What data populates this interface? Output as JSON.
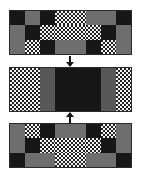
{
  "figure": {
    "name": "three-stage-block-pattern-diagram",
    "background": "#ffffff",
    "width": 141,
    "height": 177
  },
  "palette": {
    "grey": "#6e6e6e",
    "midgrey": "#585858",
    "dark": "#171717",
    "light": "#f2f2f2",
    "border": "#2b2b2b",
    "arrow": "#151515"
  },
  "legend_keys": [
    {
      "key": "grey",
      "label": "grey"
    },
    {
      "key": "dark",
      "label": "dark-speckled"
    },
    {
      "key": "light",
      "label": "light-hatched"
    },
    {
      "key": "midgrey",
      "label": "mid-grey"
    }
  ],
  "panels": [
    {
      "id": "panel-top",
      "name": "panel-top",
      "x": 9,
      "y": 10,
      "width": 123,
      "height": 45,
      "cols": 8,
      "rows": 3,
      "cells": [
        {
          "c": 1,
          "r": 1,
          "cw": 1,
          "ch": 1,
          "fill": "dark"
        },
        {
          "c": 2,
          "r": 1,
          "cw": 1,
          "ch": 1,
          "fill": "grey"
        },
        {
          "c": 3,
          "r": 1,
          "cw": 1,
          "ch": 1,
          "fill": "dark"
        },
        {
          "c": 4,
          "r": 1,
          "cw": 1,
          "ch": 1,
          "fill": "light"
        },
        {
          "c": 5,
          "r": 1,
          "cw": 1,
          "ch": 1,
          "fill": "light"
        },
        {
          "c": 6,
          "r": 1,
          "cw": 1,
          "ch": 1,
          "fill": "grey"
        },
        {
          "c": 7,
          "r": 1,
          "cw": 1,
          "ch": 1,
          "fill": "grey"
        },
        {
          "c": 8,
          "r": 1,
          "cw": 1,
          "ch": 1,
          "fill": "dark"
        },
        {
          "c": 1,
          "r": 2,
          "cw": 1,
          "ch": 1,
          "fill": "grey"
        },
        {
          "c": 2,
          "r": 2,
          "cw": 1,
          "ch": 1,
          "fill": "dark"
        },
        {
          "c": 3,
          "r": 2,
          "cw": 1,
          "ch": 1,
          "fill": "light"
        },
        {
          "c": 4,
          "r": 2,
          "cw": 1,
          "ch": 1,
          "fill": "light"
        },
        {
          "c": 5,
          "r": 2,
          "cw": 1,
          "ch": 1,
          "fill": "light"
        },
        {
          "c": 6,
          "r": 2,
          "cw": 1,
          "ch": 1,
          "fill": "light"
        },
        {
          "c": 7,
          "r": 2,
          "cw": 1,
          "ch": 1,
          "fill": "dark"
        },
        {
          "c": 8,
          "r": 2,
          "cw": 1,
          "ch": 1,
          "fill": "grey"
        },
        {
          "c": 1,
          "r": 3,
          "cw": 1,
          "ch": 1,
          "fill": "grey"
        },
        {
          "c": 2,
          "r": 3,
          "cw": 1,
          "ch": 1,
          "fill": "light"
        },
        {
          "c": 3,
          "r": 3,
          "cw": 1,
          "ch": 1,
          "fill": "dark"
        },
        {
          "c": 4,
          "r": 3,
          "cw": 1,
          "ch": 1,
          "fill": "grey"
        },
        {
          "c": 5,
          "r": 3,
          "cw": 1,
          "ch": 1,
          "fill": "grey"
        },
        {
          "c": 6,
          "r": 3,
          "cw": 1,
          "ch": 1,
          "fill": "dark"
        },
        {
          "c": 7,
          "r": 3,
          "cw": 1,
          "ch": 1,
          "fill": "light"
        },
        {
          "c": 8,
          "r": 3,
          "cw": 1,
          "ch": 1,
          "fill": "grey"
        }
      ]
    },
    {
      "id": "panel-middle",
      "name": "panel-middle",
      "x": 9,
      "y": 67,
      "width": 123,
      "height": 45,
      "cols": 8,
      "rows": 1,
      "cells": [
        {
          "c": 1,
          "r": 1,
          "cw": 2,
          "ch": 1,
          "fill": "light"
        },
        {
          "c": 3,
          "r": 1,
          "cw": 1,
          "ch": 1,
          "fill": "midgrey"
        },
        {
          "c": 4,
          "r": 1,
          "cw": 3,
          "ch": 1,
          "fill": "dark"
        },
        {
          "c": 7,
          "r": 1,
          "cw": 1,
          "ch": 1,
          "fill": "midgrey"
        },
        {
          "c": 8,
          "r": 1,
          "cw": 1,
          "ch": 1,
          "fill": "light"
        }
      ]
    },
    {
      "id": "panel-bottom",
      "name": "panel-bottom",
      "x": 9,
      "y": 123,
      "width": 123,
      "height": 45,
      "cols": 8,
      "rows": 3,
      "cells": [
        {
          "c": 1,
          "r": 1,
          "cw": 1,
          "ch": 1,
          "fill": "grey"
        },
        {
          "c": 2,
          "r": 1,
          "cw": 1,
          "ch": 1,
          "fill": "light"
        },
        {
          "c": 3,
          "r": 1,
          "cw": 1,
          "ch": 1,
          "fill": "dark"
        },
        {
          "c": 4,
          "r": 1,
          "cw": 1,
          "ch": 1,
          "fill": "grey"
        },
        {
          "c": 5,
          "r": 1,
          "cw": 1,
          "ch": 1,
          "fill": "grey"
        },
        {
          "c": 6,
          "r": 1,
          "cw": 1,
          "ch": 1,
          "fill": "dark"
        },
        {
          "c": 7,
          "r": 1,
          "cw": 1,
          "ch": 1,
          "fill": "light"
        },
        {
          "c": 8,
          "r": 1,
          "cw": 1,
          "ch": 1,
          "fill": "grey"
        },
        {
          "c": 1,
          "r": 2,
          "cw": 1,
          "ch": 1,
          "fill": "grey"
        },
        {
          "c": 2,
          "r": 2,
          "cw": 1,
          "ch": 1,
          "fill": "dark"
        },
        {
          "c": 3,
          "r": 2,
          "cw": 1,
          "ch": 1,
          "fill": "light"
        },
        {
          "c": 4,
          "r": 2,
          "cw": 1,
          "ch": 1,
          "fill": "light"
        },
        {
          "c": 5,
          "r": 2,
          "cw": 1,
          "ch": 1,
          "fill": "light"
        },
        {
          "c": 6,
          "r": 2,
          "cw": 1,
          "ch": 1,
          "fill": "light"
        },
        {
          "c": 7,
          "r": 2,
          "cw": 1,
          "ch": 1,
          "fill": "dark"
        },
        {
          "c": 8,
          "r": 2,
          "cw": 1,
          "ch": 1,
          "fill": "grey"
        },
        {
          "c": 1,
          "r": 3,
          "cw": 1,
          "ch": 1,
          "fill": "dark"
        },
        {
          "c": 2,
          "r": 3,
          "cw": 1,
          "ch": 1,
          "fill": "grey"
        },
        {
          "c": 3,
          "r": 3,
          "cw": 1,
          "ch": 1,
          "fill": "grey"
        },
        {
          "c": 4,
          "r": 3,
          "cw": 1,
          "ch": 1,
          "fill": "light"
        },
        {
          "c": 5,
          "r": 3,
          "cw": 1,
          "ch": 1,
          "fill": "light"
        },
        {
          "c": 6,
          "r": 3,
          "cw": 1,
          "ch": 1,
          "fill": "grey"
        },
        {
          "c": 7,
          "r": 3,
          "cw": 1,
          "ch": 1,
          "fill": "grey"
        },
        {
          "c": 8,
          "r": 3,
          "cw": 1,
          "ch": 1,
          "fill": "dark"
        }
      ]
    }
  ],
  "arrows": [
    {
      "id": "arrow-top-down",
      "name": "arrow-down-top-to-middle",
      "direction": "down",
      "x": 66,
      "y": 56,
      "height": 11
    },
    {
      "id": "arrow-bottom-up",
      "name": "arrow-up-bottom-to-middle",
      "direction": "up",
      "x": 66,
      "y": 112,
      "height": 11
    }
  ]
}
